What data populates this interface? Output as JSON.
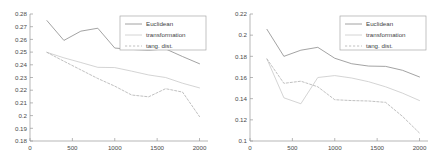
{
  "figure": {
    "background": "#ffffff",
    "axis_color": "#9a9a9a",
    "text_color": "#4a4a4a"
  },
  "legend": {
    "entries": [
      {
        "label": "Euclidean",
        "style": "solid",
        "color": "#8c8c8c"
      },
      {
        "label": "transformation",
        "style": "solid",
        "color": "#c9c9c9"
      },
      {
        "label": "tang. dist.",
        "style": "dashed",
        "color": "#b0b0b0"
      }
    ]
  },
  "chart_data": [
    {
      "type": "line",
      "title": "",
      "xlabel": "",
      "ylabel": "",
      "xlim": [
        0,
        2100
      ],
      "ylim": [
        0.18,
        0.28
      ],
      "xticks": [
        0,
        500,
        1000,
        1500,
        2000
      ],
      "xticklabels": [
        "0",
        "500",
        "1000",
        "1500",
        "2000"
      ],
      "yticks": [
        0.18,
        0.19,
        0.2,
        0.21,
        0.22,
        0.23,
        0.24,
        0.25,
        0.26,
        0.27,
        0.28
      ],
      "yticklabels": [
        "0.18",
        "0.19",
        "0.2",
        "0.21",
        "0.22",
        "0.23",
        "0.24",
        "0.25",
        "0.26",
        "0.27",
        "0.28"
      ],
      "grid": false,
      "legend_position": "upper right",
      "x": [
        200,
        400,
        600,
        800,
        1000,
        1200,
        1400,
        1600,
        1800,
        2000
      ],
      "series": [
        {
          "name": "Euclidean",
          "style": "solid",
          "color": "#8c8c8c",
          "values": [
            0.2748,
            0.2592,
            0.2665,
            0.2688,
            0.2532,
            0.2521,
            0.2515,
            0.2525,
            0.2465,
            0.2408
          ]
        },
        {
          "name": "transformation",
          "style": "solid",
          "color": "#c9c9c9",
          "values": [
            0.2498,
            0.2455,
            0.2418,
            0.238,
            0.2378,
            0.235,
            0.232,
            0.23,
            0.2255,
            0.2218
          ]
        },
        {
          "name": "tang. dist.",
          "style": "dashed",
          "color": "#b0b0b0",
          "values": [
            0.2498,
            0.2428,
            0.236,
            0.2292,
            0.2232,
            0.2162,
            0.2148,
            0.2212,
            0.2185,
            0.1992
          ]
        }
      ]
    },
    {
      "type": "line",
      "title": "",
      "xlabel": "",
      "ylabel": "",
      "xlim": [
        0,
        2100
      ],
      "ylim": [
        0.1,
        0.22
      ],
      "xticks": [
        0,
        500,
        1000,
        1500,
        2000
      ],
      "xticklabels": [
        "0",
        "500",
        "1000",
        "1500",
        "2000"
      ],
      "yticks": [
        0.1,
        0.12,
        0.14,
        0.16,
        0.18,
        0.2,
        0.22
      ],
      "yticklabels": [
        "0.1",
        "0.12",
        "0.14",
        "0.16",
        "0.18",
        "0.2",
        "0.22"
      ],
      "grid": false,
      "legend_position": "upper right",
      "x": [
        200,
        400,
        600,
        800,
        1000,
        1200,
        1400,
        1600,
        1800,
        2000
      ],
      "series": [
        {
          "name": "Euclidean",
          "style": "solid",
          "color": "#8c8c8c",
          "values": [
            0.2055,
            0.18,
            0.1858,
            0.1885,
            0.1782,
            0.173,
            0.1708,
            0.1705,
            0.1668,
            0.1605
          ]
        },
        {
          "name": "transformation",
          "style": "solid",
          "color": "#c9c9c9",
          "values": [
            0.1775,
            0.1408,
            0.1352,
            0.16,
            0.1618,
            0.1595,
            0.156,
            0.1512,
            0.1452,
            0.1382
          ]
        },
        {
          "name": "tang. dist.",
          "style": "dashed",
          "color": "#b0b0b0",
          "values": [
            0.1775,
            0.1545,
            0.1565,
            0.1512,
            0.139,
            0.1382,
            0.1378,
            0.1365,
            0.1232,
            0.1075
          ]
        }
      ]
    }
  ]
}
